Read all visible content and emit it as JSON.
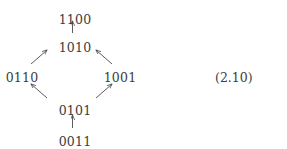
{
  "figure": {
    "equation_number": "(2.10)",
    "nodes": [
      {
        "id": "n-1100",
        "label": "1100",
        "x": 75,
        "y": 14
      },
      {
        "id": "n-1010",
        "label": "1010",
        "x": 75,
        "y": 42
      },
      {
        "id": "n-0110",
        "label": "0110",
        "x": 22,
        "y": 72
      },
      {
        "id": "n-1001",
        "label": "1001",
        "x": 120,
        "y": 72
      },
      {
        "id": "n-0101",
        "label": "0101",
        "x": 75,
        "y": 105
      },
      {
        "id": "n-0011",
        "label": "0011",
        "x": 75,
        "y": 136
      }
    ],
    "edges": [
      {
        "id": "edge-1010-to-1100",
        "from": "1010",
        "to": "1100",
        "x1": 72.5,
        "y1": 33,
        "x2": 72.5,
        "y2": 21,
        "direction": "up"
      },
      {
        "id": "edge-0110-to-1010",
        "from": "0110",
        "to": "1010",
        "x1": 31,
        "y1": 64,
        "x2": 47,
        "y2": 50,
        "direction": "up-right"
      },
      {
        "id": "edge-1001-to-1010",
        "from": "1001",
        "to": "1010",
        "x1": 112,
        "y1": 64,
        "x2": 96,
        "y2": 50,
        "direction": "up-left"
      },
      {
        "id": "edge-0101-to-0110",
        "from": "0101",
        "to": "0110",
        "x1": 47,
        "y1": 98,
        "x2": 31,
        "y2": 84,
        "direction": "up-left"
      },
      {
        "id": "edge-0101-to-1001",
        "from": "0101",
        "to": "1001",
        "x1": 96,
        "y1": 98,
        "x2": 112,
        "y2": 84,
        "direction": "up-right"
      },
      {
        "id": "edge-0011-to-0101",
        "from": "0011",
        "to": "0101",
        "x1": 72.5,
        "y1": 128,
        "x2": 72.5,
        "y2": 115,
        "direction": "up"
      }
    ]
  }
}
